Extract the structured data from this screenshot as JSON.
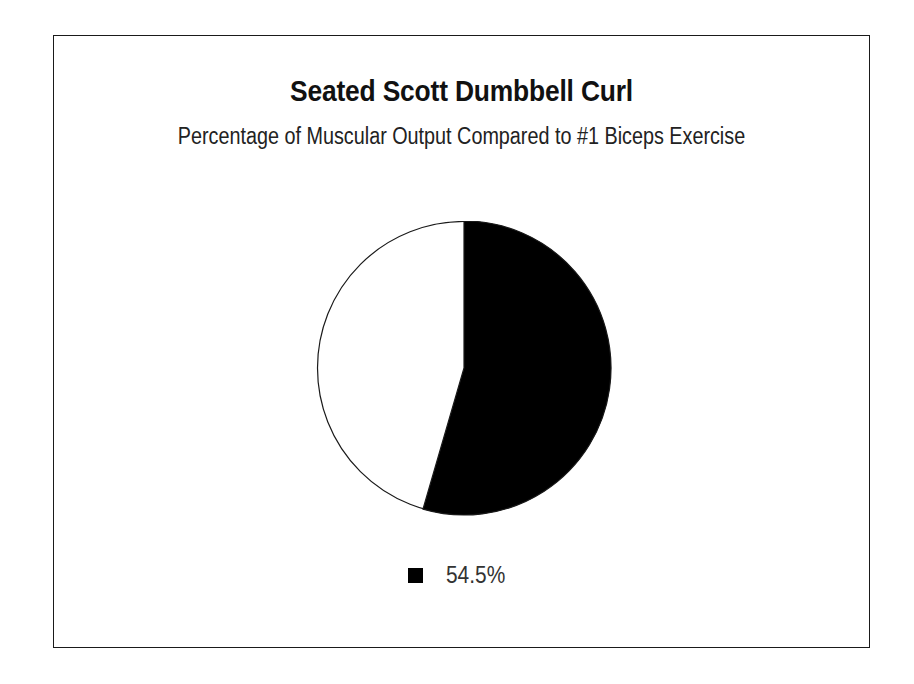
{
  "chart_data": {
    "type": "pie",
    "title": "Seated Scott Dumbbell Curl",
    "subtitle": "Percentage of Muscular Output Compared to #1 Biceps Exercise",
    "xlabel": "",
    "ylabel": "",
    "grid": false,
    "legend_position": "bottom",
    "start_angle_deg": 0,
    "direction": "clockwise",
    "categories": [
      "54.5%",
      "remainder"
    ],
    "values": [
      54.5,
      45.5
    ],
    "slices": [
      {
        "label": "54.5%",
        "value": 54.5,
        "percent_text": "54.5%",
        "sweep_deg": 196.2,
        "fill": "#000000",
        "stroke": "#1a1a1a",
        "in_legend": true
      },
      {
        "label": "",
        "value": 45.5,
        "percent_text": "",
        "sweep_deg": 163.8,
        "fill": "#ffffff",
        "stroke": "#1a1a1a",
        "in_legend": false
      }
    ],
    "legend": [
      {
        "label": "54.5%",
        "swatch_color": "#000000"
      }
    ]
  },
  "frame": {
    "border_color": "#1a1a1a",
    "background": "#ffffff"
  },
  "geometry": {
    "center_x": 150,
    "center_y": 147,
    "radius": 147
  }
}
